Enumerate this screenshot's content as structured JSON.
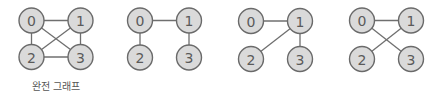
{
  "colors": {
    "background": "#ffffff",
    "node_fill": "#dadada",
    "node_stroke": "#6a6a6a",
    "edge": "#6f6f6f",
    "label": "#5a5a5a"
  },
  "node_radius": 12.5,
  "graphs": [
    {
      "caption": "완전 그래프",
      "nodes": [
        {
          "id": "0",
          "x": 31.5,
          "y": 20.5
        },
        {
          "id": "1",
          "x": 80.5,
          "y": 20.5
        },
        {
          "id": "2",
          "x": 31.5,
          "y": 57
        },
        {
          "id": "3",
          "x": 80.5,
          "y": 57
        }
      ],
      "edges": [
        [
          "0",
          "1"
        ],
        [
          "0",
          "2"
        ],
        [
          "0",
          "3"
        ],
        [
          "1",
          "2"
        ],
        [
          "1",
          "3"
        ],
        [
          "2",
          "3"
        ]
      ]
    },
    {
      "caption": "",
      "nodes": [
        {
          "id": "0",
          "x": 140,
          "y": 20.5
        },
        {
          "id": "1",
          "x": 189,
          "y": 20.5
        },
        {
          "id": "2",
          "x": 140,
          "y": 57.5
        },
        {
          "id": "3",
          "x": 189,
          "y": 57.5
        }
      ],
      "edges": [
        [
          "0",
          "1"
        ],
        [
          "0",
          "2"
        ],
        [
          "1",
          "3"
        ]
      ]
    },
    {
      "caption": "",
      "nodes": [
        {
          "id": "0",
          "x": 251,
          "y": 21
        },
        {
          "id": "1",
          "x": 300,
          "y": 21
        },
        {
          "id": "2",
          "x": 251,
          "y": 59
        },
        {
          "id": "3",
          "x": 300,
          "y": 59
        }
      ],
      "edges": [
        [
          "0",
          "1"
        ],
        [
          "1",
          "2"
        ],
        [
          "1",
          "3"
        ]
      ]
    },
    {
      "caption": "",
      "nodes": [
        {
          "id": "0",
          "x": 362,
          "y": 20.5
        },
        {
          "id": "1",
          "x": 411,
          "y": 20.5
        },
        {
          "id": "2",
          "x": 362,
          "y": 59
        },
        {
          "id": "3",
          "x": 411,
          "y": 59
        }
      ],
      "edges": [
        [
          "0",
          "1"
        ],
        [
          "0",
          "3"
        ],
        [
          "1",
          "2"
        ]
      ]
    }
  ]
}
